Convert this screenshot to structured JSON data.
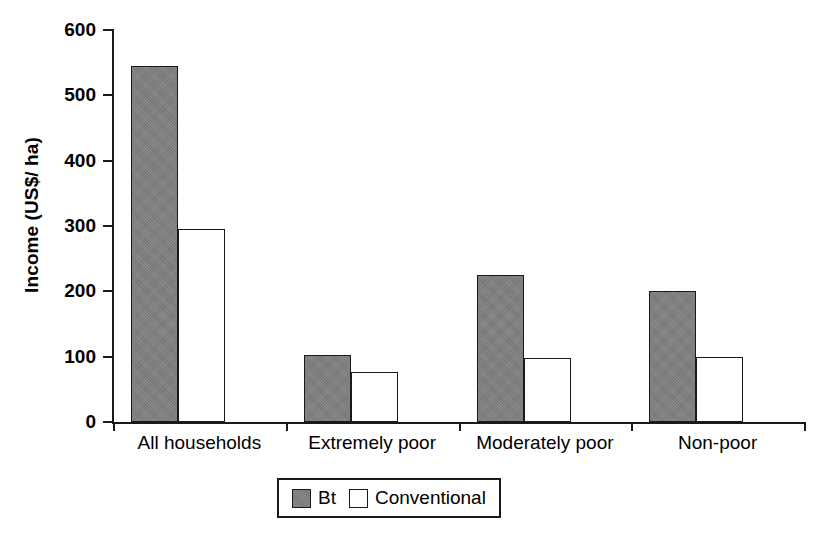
{
  "chart_data": {
    "type": "bar",
    "title": "",
    "subtitle": "",
    "xlabel": "",
    "ylabel": "Income (US$/ ha)",
    "categories": [
      "All households",
      "Extremely poor",
      "Moderately poor",
      "Non-poor"
    ],
    "series": [
      {
        "name": "Bt",
        "color": "#7f7f7f",
        "values": [
          545,
          102,
          225,
          200
        ]
      },
      {
        "name": "Conventional",
        "color": "#ffffff",
        "values": [
          296,
          77,
          98,
          100
        ]
      }
    ],
    "ylim": [
      0,
      600
    ],
    "ytick_values": [
      0,
      100,
      200,
      300,
      400,
      500,
      600
    ],
    "ytick_labels": [
      "0",
      "100",
      "200",
      "300",
      "400",
      "500",
      "600"
    ],
    "grid": false,
    "legend_position": "bottom-center",
    "legend_entries": [
      "Bt",
      "Conventional"
    ]
  },
  "axis": {
    "y_title": "Income (US$/ ha)"
  }
}
